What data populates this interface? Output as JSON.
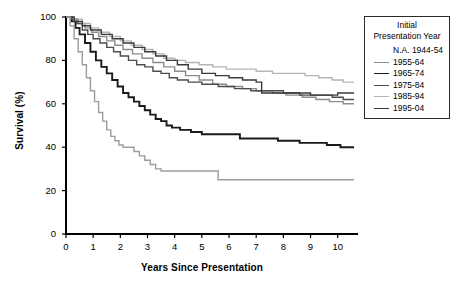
{
  "chart_data": {
    "type": "line",
    "title": "",
    "xlabel": "Years Since Presentation",
    "ylabel": "Survival (%)",
    "xlim": [
      0,
      10.6
    ],
    "ylim": [
      0,
      100
    ],
    "xticks": [
      "0",
      "1",
      "2",
      "3",
      "4",
      "5",
      "6",
      "7",
      "8",
      "9",
      "10"
    ],
    "yticks": [
      "0",
      "20",
      "40",
      "60",
      "80",
      "100"
    ],
    "grid": false,
    "legend_position": "top-right",
    "legend_title": "Initial Presentation Year",
    "step_type": "post",
    "series": [
      {
        "name": "N.A. 1944-54",
        "color": "#ffffff",
        "line_shown": false,
        "points": []
      },
      {
        "name": "1955-64",
        "color": "#8c8c8c",
        "line_shown": true,
        "final_value": 60,
        "points": [
          [
            0.0,
            100
          ],
          [
            0.25,
            99
          ],
          [
            0.45,
            97
          ],
          [
            0.7,
            95
          ],
          [
            0.95,
            93
          ],
          [
            1.2,
            91
          ],
          [
            1.5,
            89
          ],
          [
            1.8,
            87
          ],
          [
            2.1,
            85
          ],
          [
            2.45,
            83
          ],
          [
            2.8,
            81
          ],
          [
            3.2,
            79
          ],
          [
            3.6,
            77
          ],
          [
            4.0,
            75
          ],
          [
            4.4,
            73
          ],
          [
            4.9,
            71
          ],
          [
            5.4,
            69
          ],
          [
            5.9,
            68
          ],
          [
            6.5,
            67
          ],
          [
            7.0,
            66
          ],
          [
            7.6,
            65
          ],
          [
            8.1,
            64
          ],
          [
            8.7,
            63
          ],
          [
            9.2,
            62
          ],
          [
            9.7,
            61
          ],
          [
            10.2,
            60
          ],
          [
            10.6,
            60
          ]
        ]
      },
      {
        "name": "1965-74",
        "color": "#1a1a1a",
        "line_shown": true,
        "final_value": 40,
        "points": [
          [
            0.0,
            100
          ],
          [
            0.2,
            98
          ],
          [
            0.35,
            95
          ],
          [
            0.5,
            92
          ],
          [
            0.7,
            88
          ],
          [
            0.9,
            84
          ],
          [
            1.1,
            80
          ],
          [
            1.3,
            77
          ],
          [
            1.5,
            74
          ],
          [
            1.7,
            71
          ],
          [
            1.9,
            68
          ],
          [
            2.1,
            65
          ],
          [
            2.3,
            63
          ],
          [
            2.5,
            61
          ],
          [
            2.7,
            59
          ],
          [
            2.9,
            57
          ],
          [
            3.1,
            55
          ],
          [
            3.3,
            53
          ],
          [
            3.5,
            52
          ],
          [
            3.7,
            50
          ],
          [
            3.9,
            49
          ],
          [
            4.2,
            48
          ],
          [
            4.6,
            47
          ],
          [
            5.0,
            46
          ],
          [
            6.2,
            46
          ],
          [
            6.4,
            44
          ],
          [
            7.6,
            44
          ],
          [
            7.8,
            43
          ],
          [
            8.4,
            43
          ],
          [
            8.6,
            42
          ],
          [
            9.4,
            42
          ],
          [
            9.6,
            41
          ],
          [
            10.1,
            40
          ],
          [
            10.6,
            40
          ]
        ]
      },
      {
        "name": "1975-84",
        "color": "#4d4d4d",
        "line_shown": true,
        "final_value": 62,
        "points": [
          [
            0.0,
            100
          ],
          [
            0.2,
            99
          ],
          [
            0.4,
            97
          ],
          [
            0.6,
            94
          ],
          [
            0.8,
            92
          ],
          [
            1.0,
            90
          ],
          [
            1.25,
            88
          ],
          [
            1.5,
            86
          ],
          [
            1.75,
            84
          ],
          [
            2.0,
            82
          ],
          [
            2.3,
            80
          ],
          [
            2.6,
            78
          ],
          [
            2.9,
            77
          ],
          [
            3.2,
            75
          ],
          [
            3.5,
            74
          ],
          [
            3.8,
            72
          ],
          [
            4.1,
            71
          ],
          [
            4.5,
            70
          ],
          [
            5.0,
            69
          ],
          [
            5.6,
            68
          ],
          [
            6.2,
            67
          ],
          [
            6.8,
            66
          ],
          [
            7.4,
            66
          ],
          [
            8.0,
            65
          ],
          [
            8.6,
            64
          ],
          [
            9.2,
            64
          ],
          [
            9.8,
            63
          ],
          [
            10.2,
            62
          ],
          [
            10.6,
            62
          ]
        ]
      },
      {
        "name": "1985-94",
        "color": "#b5b5b5",
        "line_shown": true,
        "final_value": 70,
        "points": [
          [
            0.0,
            100
          ],
          [
            0.3,
            99
          ],
          [
            0.6,
            97
          ],
          [
            0.9,
            95
          ],
          [
            1.2,
            93
          ],
          [
            1.6,
            91
          ],
          [
            2.0,
            89
          ],
          [
            2.4,
            87
          ],
          [
            2.8,
            85
          ],
          [
            3.2,
            83
          ],
          [
            3.6,
            81
          ],
          [
            4.0,
            80
          ],
          [
            4.4,
            79
          ],
          [
            4.9,
            78
          ],
          [
            5.4,
            77
          ],
          [
            5.9,
            76
          ],
          [
            6.4,
            76
          ],
          [
            7.0,
            75
          ],
          [
            7.6,
            74
          ],
          [
            8.2,
            74
          ],
          [
            8.8,
            73
          ],
          [
            9.3,
            72
          ],
          [
            9.8,
            71
          ],
          [
            10.2,
            70
          ],
          [
            10.6,
            70
          ]
        ]
      },
      {
        "name": "1995-04",
        "color": "#3a3a3a",
        "line_shown": true,
        "final_value": 65,
        "points": [
          [
            0.0,
            100
          ],
          [
            0.3,
            98
          ],
          [
            0.6,
            96
          ],
          [
            0.9,
            94
          ],
          [
            1.3,
            92
          ],
          [
            1.7,
            90
          ],
          [
            2.1,
            88
          ],
          [
            2.5,
            86
          ],
          [
            2.9,
            84
          ],
          [
            3.3,
            82
          ],
          [
            3.7,
            80
          ],
          [
            4.1,
            78
          ],
          [
            4.5,
            76
          ],
          [
            5.0,
            74
          ],
          [
            5.5,
            73
          ],
          [
            6.0,
            72
          ],
          [
            6.5,
            71
          ],
          [
            7.0,
            70
          ],
          [
            7.2,
            65
          ],
          [
            8.6,
            65
          ],
          [
            9.0,
            64
          ],
          [
            9.6,
            64
          ],
          [
            10.0,
            65
          ],
          [
            10.6,
            65
          ]
        ]
      },
      {
        "name": "unlabeled-steep",
        "color": "#9d9d9d",
        "line_shown": true,
        "final_value": 25,
        "points": [
          [
            0.0,
            100
          ],
          [
            0.15,
            96
          ],
          [
            0.3,
            90
          ],
          [
            0.45,
            84
          ],
          [
            0.6,
            78
          ],
          [
            0.75,
            72
          ],
          [
            0.9,
            66
          ],
          [
            1.05,
            61
          ],
          [
            1.2,
            56
          ],
          [
            1.35,
            52
          ],
          [
            1.5,
            48
          ],
          [
            1.65,
            45
          ],
          [
            1.8,
            43
          ],
          [
            1.95,
            41
          ],
          [
            2.1,
            40
          ],
          [
            2.3,
            40
          ],
          [
            2.5,
            38
          ],
          [
            2.7,
            36
          ],
          [
            2.9,
            34
          ],
          [
            3.1,
            32
          ],
          [
            3.3,
            30
          ],
          [
            3.5,
            29
          ],
          [
            3.9,
            29
          ],
          [
            5.4,
            29
          ],
          [
            5.6,
            25
          ],
          [
            10.6,
            25
          ]
        ]
      }
    ]
  },
  "legend": {
    "title_line1": "Initial",
    "title_line2": "Presentation Year",
    "entries": [
      {
        "label": "N.A. 1944-54",
        "color": "#ffffff",
        "has_line": false
      },
      {
        "label": "1955-64",
        "color": "#8c8c8c",
        "has_line": true
      },
      {
        "label": "1965-74",
        "color": "#1a1a1a",
        "has_line": true
      },
      {
        "label": "1975-84",
        "color": "#4d4d4d",
        "has_line": true
      },
      {
        "label": "1985-94",
        "color": "#b5b5b5",
        "has_line": true
      },
      {
        "label": "1995-04",
        "color": "#3a3a3a",
        "has_line": true
      }
    ]
  },
  "axes": {
    "x_title": "Years Since Presentation",
    "y_title": "Survival (%)",
    "x_tick_labels": [
      "0",
      "1",
      "2",
      "3",
      "4",
      "5",
      "6",
      "7",
      "8",
      "9",
      "10"
    ],
    "y_tick_labels": [
      "100",
      "80",
      "60",
      "40",
      "20",
      "0"
    ],
    "axis_color": "#000000"
  }
}
